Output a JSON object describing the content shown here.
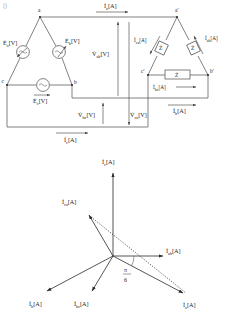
{
  "figure": {
    "corner_mark": "0",
    "circuit": {
      "title_hidden": "",
      "source_nodes": {
        "a": "a",
        "b": "b",
        "c": "c"
      },
      "load_nodes": {
        "a2": "a'",
        "b2": "b'",
        "c2": "c'"
      },
      "sources": [
        {
          "name": "source-a",
          "label": "Ė",
          "sub": "a",
          "unit": "[V]"
        },
        {
          "name": "source-b",
          "label": "Ė",
          "sub": "b",
          "unit": "[V]"
        },
        {
          "name": "source-c",
          "label": "Ė",
          "sub": "c",
          "unit": "[V]"
        }
      ],
      "impedances": [
        {
          "name": "z-ca",
          "label": "Ż"
        },
        {
          "name": "z-ab",
          "label": "Ż"
        },
        {
          "name": "z-bc",
          "label": "Ż"
        }
      ],
      "line_currents": [
        {
          "name": "line-current-a",
          "label": "İ",
          "sub": "a",
          "unit": "[A]"
        },
        {
          "name": "line-current-b",
          "label": "İ",
          "sub": "b",
          "unit": "[A]"
        },
        {
          "name": "line-current-c",
          "label": "İ",
          "sub": "c",
          "unit": "[A]"
        }
      ],
      "phase_currents": [
        {
          "name": "phase-current-ca",
          "label": "İ",
          "sub": "ca",
          "unit": "[A]"
        },
        {
          "name": "phase-current-ab",
          "label": "İ",
          "sub": "ab",
          "unit": "[A]"
        },
        {
          "name": "phase-current-bc",
          "label": "İ",
          "sub": "bc",
          "unit": "[A]"
        }
      ],
      "voltages": [
        {
          "name": "voltage-ab",
          "label": "V̇",
          "sub": "ab",
          "unit": "[V]"
        },
        {
          "name": "voltage-bc",
          "label": "V̇",
          "sub": "bc",
          "unit": "[V]"
        },
        {
          "name": "voltage-ca",
          "label": "V̇",
          "sub": "ca",
          "unit": "[V]"
        }
      ]
    },
    "phasor": {
      "type": "phasor-diagram",
      "angle_label_num": "π",
      "angle_label_den": "6",
      "vectors": [
        {
          "name": "phasor-Ic",
          "label": "İ",
          "sub": "c",
          "unit": "[A]",
          "angle_deg": 90,
          "length": 72,
          "style": "solid"
        },
        {
          "name": "phasor-Ica",
          "label": "İ",
          "sub": "ca",
          "unit": "[A]",
          "angle_deg": 150,
          "length": 62,
          "style": "solid"
        },
        {
          "name": "phasor-Iab",
          "label": "İ",
          "sub": "ab",
          "unit": "[A]",
          "angle_deg": 0,
          "length": 55,
          "style": "solid"
        },
        {
          "name": "phasor-Ib",
          "label": "İ",
          "sub": "b",
          "unit": "[A]",
          "angle_deg": 210,
          "length": 70,
          "style": "solid"
        },
        {
          "name": "phasor-Ibc",
          "label": "İ",
          "sub": "bc",
          "unit": "[A]",
          "angle_deg": 258,
          "length": 62,
          "style": "solid"
        },
        {
          "name": "phasor-Ia",
          "label": "İ",
          "sub": "a",
          "unit": "[A]",
          "angle_deg": 330,
          "length": 70,
          "style": "solid"
        }
      ],
      "construction_lines": [
        {
          "name": "dotted-ca-to-a",
          "from": "Ica-tip",
          "to": "Ia-tip",
          "style": "dotted"
        }
      ]
    }
  },
  "colors": {
    "ink": "#2a2a2a",
    "wire": "#4a4a4a",
    "background": "#ffffff",
    "faint": "#b9b9b9"
  }
}
